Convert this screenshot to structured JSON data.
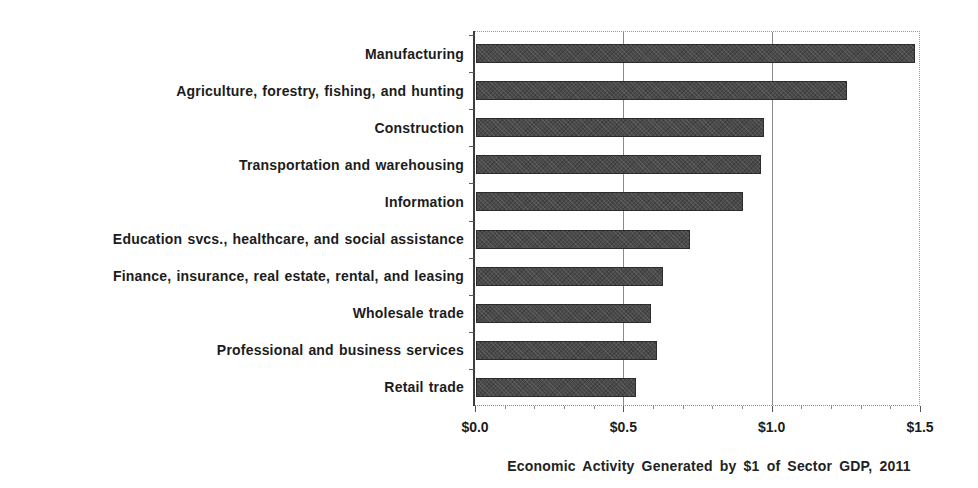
{
  "chart_data": {
    "type": "bar",
    "orientation": "horizontal",
    "title": "",
    "caption": "Economic Activity Generated by $1 of Sector GDP, 2011",
    "categories": [
      "Manufacturing",
      "Agriculture, forestry, fishing, and hunting",
      "Construction",
      "Transportation and warehousing",
      "Information",
      "Education svcs., healthcare, and social assistance",
      "Finance, insurance, real estate, rental, and leasing",
      "Wholesale trade",
      "Professional and business services",
      "Retail trade"
    ],
    "values": [
      1.48,
      1.25,
      0.97,
      0.96,
      0.9,
      0.72,
      0.63,
      0.59,
      0.61,
      0.54
    ],
    "xlim": [
      0,
      1.5
    ],
    "x_tick_values": [
      0.0,
      0.5,
      1.0,
      1.5
    ],
    "x_tick_labels": [
      "$0.0",
      "$0.5",
      "$1.0",
      "$1.5"
    ],
    "minor_tick_step": 0.1,
    "grid_values": [
      0.5,
      1.0
    ],
    "grid_on": true,
    "legend": "none",
    "bar_color": "#4a4a4a",
    "axis_color": "#3d3d3d"
  }
}
